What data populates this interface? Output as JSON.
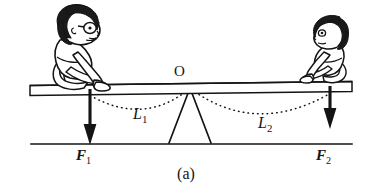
{
  "figure": {
    "caption": "(a)",
    "colors": {
      "ink": "#141414",
      "paper": "#ffffff",
      "hair": "#1a1a1a",
      "skin": "#ffffff"
    },
    "labels": {
      "fulcrum": {
        "text": "O",
        "name": "fulcrum-point-label"
      },
      "arm_left": {
        "base": "L",
        "subscript": "1",
        "name": "lever-arm-left-label"
      },
      "arm_right": {
        "base": "L",
        "subscript": "2",
        "name": "lever-arm-right-label"
      },
      "force_left": {
        "base": "F",
        "subscript": "1",
        "name": "force-left-label"
      },
      "force_right": {
        "base": "F",
        "subscript": "2",
        "name": "force-right-label"
      }
    },
    "elements": {
      "plank": "horizontal-board",
      "fulcrum": "triangular-support",
      "ground": "ground-line",
      "child_left": "larger-child-with-glasses-facing-right",
      "child_right": "smaller-child-facing-left",
      "arrow_left": "downward-force-arrow",
      "arrow_right": "downward-force-arrow",
      "arc_left": "dotted-arc-lever-arm-1",
      "arc_right": "dotted-arc-lever-arm-2"
    }
  }
}
